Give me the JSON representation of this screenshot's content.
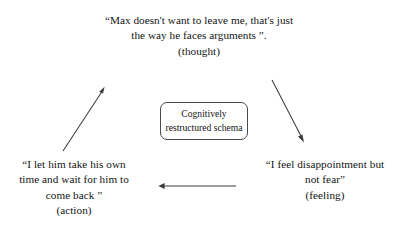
{
  "diagram": {
    "background_color": "#ffffff",
    "text_color": "#141414",
    "line_color": "#3c3c3c",
    "center_box": {
      "line1": "Cognitively",
      "line2": "restructured schema"
    },
    "nodes": {
      "thought": {
        "line1": "“Max doesn't want to leave me, that's just",
        "line2": "the way he faces arguments ”.",
        "role": "(thought)"
      },
      "action": {
        "line1": "“I let him take his own",
        "line2": "time and wait for him to",
        "line3": "come back ”",
        "role": "(action)"
      },
      "feeling": {
        "line1": "“I feel disappointment but",
        "line2": "not fear”",
        "role": "(feeling)"
      }
    },
    "arrows": [
      {
        "name": "action-to-thought",
        "from": "action",
        "to": "thought",
        "direction": "up-right"
      },
      {
        "name": "thought-to-feeling",
        "from": "thought",
        "to": "feeling",
        "direction": "down-right"
      },
      {
        "name": "feeling-to-action",
        "from": "feeling",
        "to": "action",
        "direction": "left"
      }
    ]
  }
}
